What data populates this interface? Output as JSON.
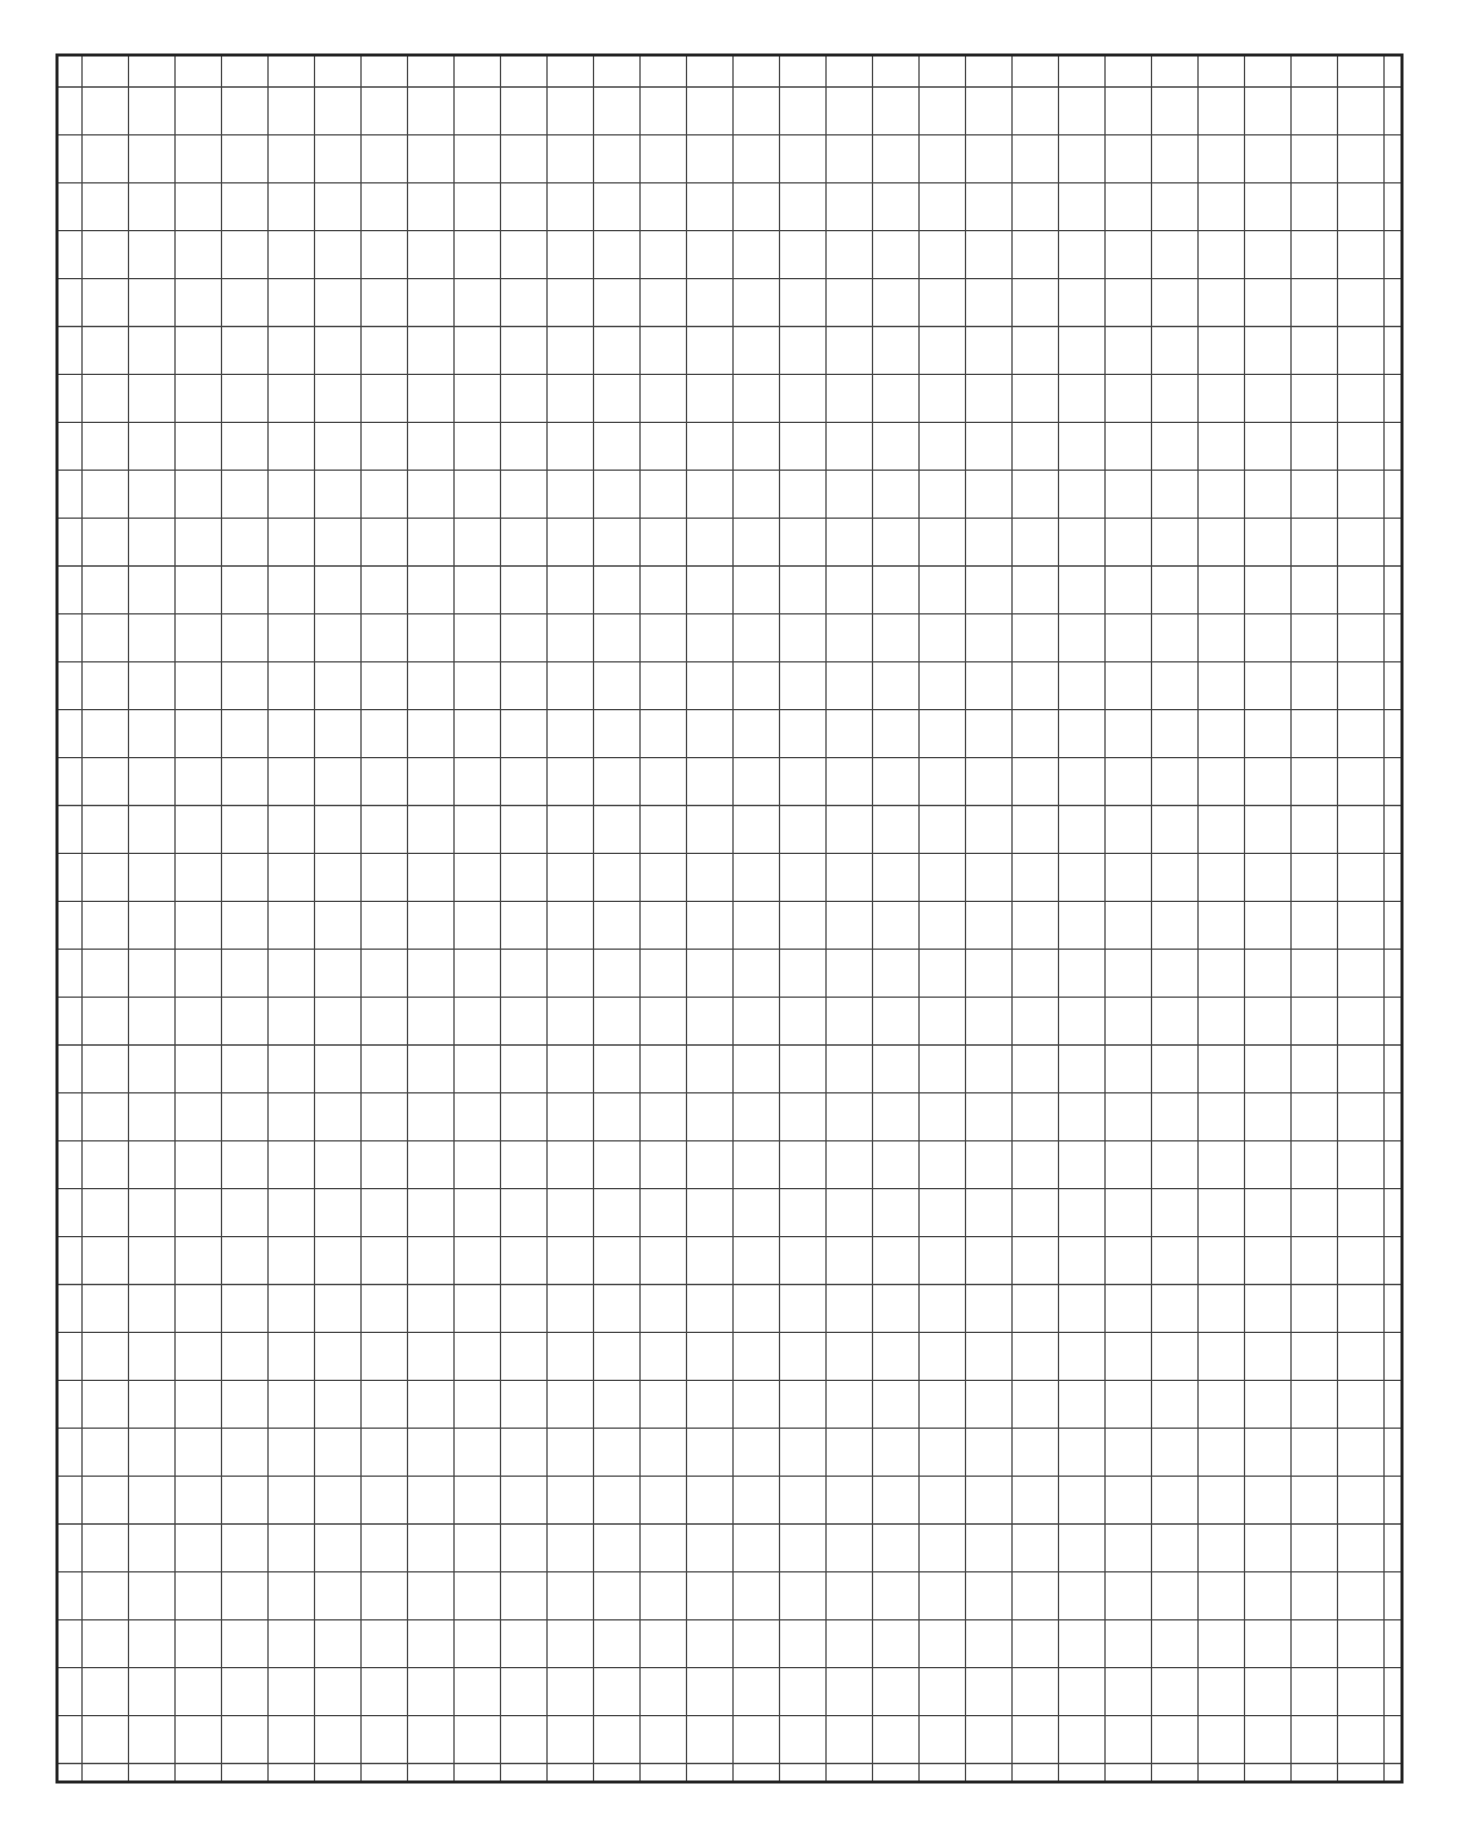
{
  "page": {
    "type": "graph-paper",
    "background": "#ffffff",
    "line_color": "#444444",
    "border_color": "#222222"
  },
  "grid": {
    "border": {
      "left": 57,
      "top": 55,
      "right": 1402,
      "bottom": 1782,
      "width": 3
    },
    "vertical_lines": {
      "first_x": 82,
      "spacing": 46.5,
      "count": 29
    },
    "horizontal_lines": {
      "first_y": 87,
      "spacing": 47.9,
      "count": 36
    },
    "line_width": 1.3
  },
  "footer": {
    "text": ""
  }
}
